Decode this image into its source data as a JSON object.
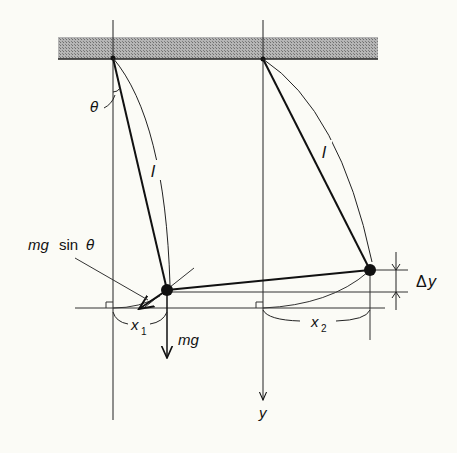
{
  "diagram": {
    "colors": {
      "background": "#fbfbf6",
      "ink": "#111111",
      "ceiling_fill": "#9a9a9a"
    },
    "labels": {
      "theta": "θ",
      "length_left": "l",
      "length_right": "l",
      "mg_sin_prefix": "mg",
      "mg_sin_func": "sin",
      "mg_sin_theta": "θ",
      "mg": "mg",
      "x1_base": "x",
      "x1_sub": "1",
      "x2_base": "x",
      "x2_sub": "2",
      "delta_y_delta": "Δ",
      "delta_y_var": "y",
      "y_axis": "y"
    },
    "elements": {
      "ceiling": "hatched support beam",
      "pivots": [
        "left pivot",
        "right pivot"
      ],
      "bobs": [
        "left bob",
        "right bob"
      ],
      "connecting_string": "string between bobs",
      "force_arrows": [
        "mg sin θ (tangential)",
        "mg (gravity)"
      ],
      "dimensions": [
        "x1 horizontal displacement",
        "x2 horizontal displacement",
        "Δy vertical offset"
      ]
    }
  }
}
